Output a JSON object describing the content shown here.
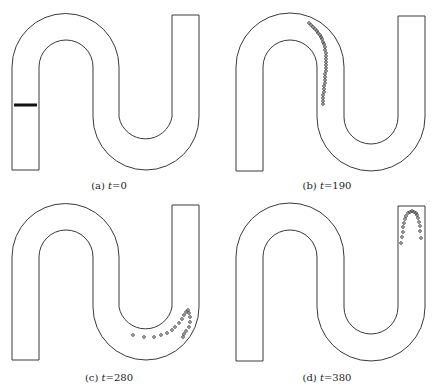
{
  "figure": {
    "panels": [
      {
        "id": "a",
        "label": "(a)",
        "var": "t",
        "eq": "=",
        "value": "0",
        "caption_y": 181,
        "particles_type": "line",
        "particles": [
          [
            14,
            105
          ],
          [
            37,
            105
          ]
        ]
      },
      {
        "id": "b",
        "label": "(b)",
        "var": "t",
        "eq": "=",
        "value": "190",
        "caption_y": 181,
        "particles_type": "dots",
        "particles": [
          [
            91,
            23
          ],
          [
            93,
            25
          ],
          [
            95,
            27
          ],
          [
            97,
            29
          ],
          [
            99,
            31
          ],
          [
            100,
            33
          ],
          [
            102,
            35
          ],
          [
            103,
            37
          ],
          [
            104,
            39
          ],
          [
            105,
            42
          ],
          [
            106,
            44
          ],
          [
            107,
            47
          ],
          [
            107,
            50
          ],
          [
            108,
            53
          ],
          [
            108,
            56
          ],
          [
            108,
            59
          ],
          [
            108,
            62
          ],
          [
            108,
            65
          ],
          [
            108,
            68
          ],
          [
            108,
            71
          ],
          [
            107,
            74
          ],
          [
            107,
            77
          ],
          [
            107,
            80
          ],
          [
            107,
            83
          ],
          [
            106,
            86
          ],
          [
            106,
            89
          ],
          [
            106,
            92
          ],
          [
            105,
            95
          ],
          [
            105,
            98
          ],
          [
            105,
            101
          ],
          [
            105,
            104
          ]
        ]
      },
      {
        "id": "c",
        "label": "(c)",
        "var": "t",
        "eq": "=",
        "value": "280",
        "caption_y": 178,
        "particles_type": "dots",
        "particles": [
          [
            133,
            140
          ],
          [
            144,
            142
          ],
          [
            154,
            142
          ],
          [
            161,
            140
          ],
          [
            167,
            138
          ],
          [
            172,
            135
          ],
          [
            175,
            132
          ],
          [
            179,
            128
          ],
          [
            182,
            124
          ],
          [
            184,
            120
          ],
          [
            186,
            117
          ],
          [
            188,
            115
          ],
          [
            189,
            118
          ],
          [
            190,
            122
          ],
          [
            190,
            127
          ],
          [
            189,
            132
          ],
          [
            186,
            136
          ],
          [
            184,
            139
          ],
          [
            183,
            142
          ]
        ]
      },
      {
        "id": "d",
        "label": "(d)",
        "var": "t",
        "eq": "=",
        "value": "380",
        "caption_y": 178,
        "particles_type": "dots",
        "particles": [
          [
            183,
            48
          ],
          [
            184,
            42
          ],
          [
            185,
            37
          ],
          [
            185,
            32
          ],
          [
            186,
            28
          ],
          [
            187,
            24
          ],
          [
            188,
            21
          ],
          [
            190,
            18
          ],
          [
            192,
            17
          ],
          [
            194,
            16
          ],
          [
            196,
            17
          ],
          [
            198,
            18
          ],
          [
            199,
            20
          ],
          [
            200,
            23
          ],
          [
            201,
            27
          ],
          [
            202,
            31
          ],
          [
            202,
            36
          ],
          [
            203,
            43
          ]
        ]
      }
    ]
  },
  "colors": {
    "stroke": "#3a3a3a",
    "particle": "#333333"
  }
}
